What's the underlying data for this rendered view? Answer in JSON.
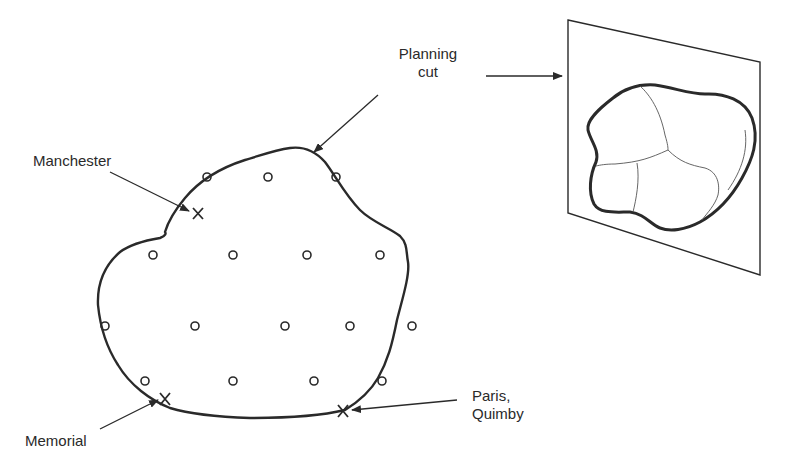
{
  "diagram": {
    "type": "planning-cut-illustration",
    "colors": {
      "ink": "#2a2a2a",
      "background": "#ffffff"
    },
    "labels": {
      "manchester": "Manchester",
      "planning_cut_line1": "Planning",
      "planning_cut_line2": "cut",
      "memorial": "Memorial",
      "paris_line1": "Paris,",
      "paris_line2": "Quimby"
    },
    "markers": {
      "site_symbol": "o",
      "selected_symbol": "X",
      "sites": [
        [
          207,
          177
        ],
        [
          268,
          177
        ],
        [
          336,
          177
        ],
        [
          153,
          255
        ],
        [
          233,
          255
        ],
        [
          307,
          255
        ],
        [
          380,
          255
        ],
        [
          105,
          326
        ],
        [
          195,
          326
        ],
        [
          285,
          326
        ],
        [
          350,
          326
        ],
        [
          412,
          326
        ],
        [
          145,
          381
        ],
        [
          233,
          381
        ],
        [
          314,
          381
        ],
        [
          382,
          381
        ]
      ],
      "selected": [
        {
          "name": "Manchester",
          "x": 198,
          "y": 213
        },
        {
          "name": "Memorial",
          "x": 165,
          "y": 399
        },
        {
          "name": "Paris, Quimby",
          "x": 343,
          "y": 411
        }
      ]
    },
    "inset": {
      "description": "Planning cut projected onto a plane, showing region partitioned into zones"
    }
  }
}
